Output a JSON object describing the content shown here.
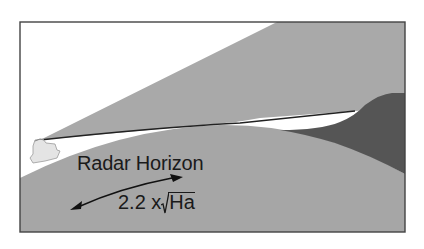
{
  "diagram": {
    "title": "Radar Horizon",
    "formula": {
      "coefficient": "2.2 x",
      "radicand": "Ha"
    },
    "elements": {
      "ship": "radar-ship",
      "beam": "radar-beam",
      "earth": "earth-curvature",
      "shadow": "radar-shadow-target",
      "arrow": "double-headed-arrow"
    },
    "colors": {
      "background": "#ffffff",
      "beam": "#a9a9a9",
      "earth": "#a6a6a6",
      "shadow": "#555555",
      "frame": "#444444",
      "ship": "#e4e4e4",
      "text": "#1a1a1a"
    }
  }
}
